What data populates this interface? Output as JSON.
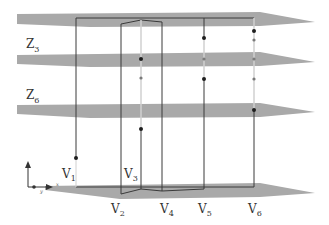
{
  "diagram": {
    "type": "layered-planes",
    "colors": {
      "plane": "#a9a9a9",
      "line_dark": "#3a3a3a",
      "line_light": "#d0d0d0",
      "dot": "#1e1e1e",
      "dot_light": "#7a7a7a",
      "text": "#333333"
    },
    "plane_labels": [
      {
        "id": "z3",
        "main": "Z",
        "sub": "3",
        "x": 38,
        "y": 48
      },
      {
        "id": "z6",
        "main": "Z",
        "sub": "6",
        "x": 38,
        "y": 99
      }
    ],
    "vertex_labels": [
      {
        "id": "v1",
        "main": "V",
        "sub": "1",
        "x": 62,
        "y": 176
      },
      {
        "id": "v2",
        "main": "V",
        "sub": "2",
        "x": 112,
        "y": 213
      },
      {
        "id": "v3",
        "main": "V",
        "sub": "3",
        "x": 124,
        "y": 176
      },
      {
        "id": "v4",
        "main": "V",
        "sub": "4",
        "x": 160,
        "y": 213
      },
      {
        "id": "v5",
        "main": "V",
        "sub": "5",
        "x": 198,
        "y": 213
      },
      {
        "id": "v6",
        "main": "V",
        "sub": "6",
        "x": 248,
        "y": 213
      }
    ],
    "axis_indicator": {
      "labels": [
        "z",
        "x",
        "y"
      ]
    }
  }
}
